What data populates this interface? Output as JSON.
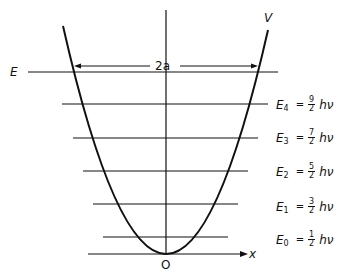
{
  "diagram": {
    "potential_label": "V",
    "energy_label": "E",
    "width_label": "2a",
    "x_axis_label": "x",
    "origin_label": "O",
    "levels": [
      {
        "name": "E",
        "sub": "4",
        "num": "9",
        "den": "2",
        "unit": "hν"
      },
      {
        "name": "E",
        "sub": "3",
        "num": "7",
        "den": "2",
        "unit": "hν"
      },
      {
        "name": "E",
        "sub": "2",
        "num": "5",
        "den": "2",
        "unit": "hν"
      },
      {
        "name": "E",
        "sub": "1",
        "num": "3",
        "den": "2",
        "unit": "hν"
      },
      {
        "name": "E",
        "sub": "0",
        "num": "1",
        "den": "2",
        "unit": "hν"
      }
    ],
    "equals": "="
  }
}
